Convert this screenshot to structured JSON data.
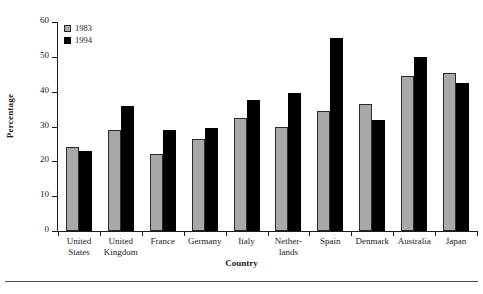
{
  "chart_data": {
    "type": "bar",
    "title": "",
    "xlabel": "Country",
    "ylabel": "Percentage",
    "ylim": [
      0,
      60
    ],
    "yticks": [
      0,
      10,
      20,
      30,
      40,
      50,
      60
    ],
    "grid": false,
    "legend_position": "top-left",
    "categories": [
      "United States",
      "United Kingdom",
      "France",
      "Germany",
      "Italy",
      "Netherlands",
      "Spain",
      "Denmark",
      "Australia",
      "Japan"
    ],
    "category_lines": [
      [
        "United",
        "States"
      ],
      [
        "United",
        "Kingdom"
      ],
      [
        "France"
      ],
      [
        "Germany"
      ],
      [
        "Italy"
      ],
      [
        "Nether-",
        "lands"
      ],
      [
        "Spain"
      ],
      [
        "Denmark"
      ],
      [
        "Australia"
      ],
      [
        "Japan"
      ]
    ],
    "series": [
      {
        "name": "1983",
        "color": "#a8a8a8",
        "values": [
          24,
          29,
          22,
          26.5,
          32.5,
          30,
          34.5,
          36.5,
          44.5,
          45.5
        ]
      },
      {
        "name": "1994",
        "color": "#000000",
        "values": [
          23,
          36,
          29,
          29.5,
          37.5,
          39.5,
          55.5,
          32,
          50,
          42.5
        ]
      }
    ]
  },
  "legend": {
    "items": [
      {
        "label": "1983",
        "swatch": "gray-hatched-swatch"
      },
      {
        "label": "1994",
        "swatch": "black-swatch"
      }
    ]
  }
}
